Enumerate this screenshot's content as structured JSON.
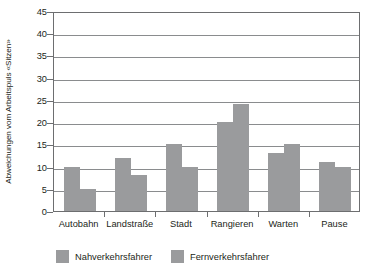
{
  "chart_data": {
    "type": "bar",
    "title": "",
    "subtitle": "",
    "xlabel": "",
    "ylabel": "Abweichungen vom Arbeitspuls «Sitzen»",
    "ylim": [
      0,
      45
    ],
    "ytick_step": 5,
    "yticks": [
      "0",
      "5",
      "10",
      "15",
      "20",
      "25",
      "30",
      "35",
      "40",
      "45"
    ],
    "grid": true,
    "legend_position": "bottom-left",
    "categories": [
      "Autobahn",
      "Landstraße",
      "Stadt",
      "Rangieren",
      "Warten",
      "Pause"
    ],
    "series": [
      {
        "name": "Nahverkehrsfahrer",
        "color": "#9a9b9d",
        "values": [
          10,
          12,
          15,
          20,
          13,
          11
        ]
      },
      {
        "name": "Fernverkehrsfahrer",
        "color": "#9a9b9d",
        "values": [
          5,
          8,
          10,
          24,
          15,
          10
        ]
      }
    ]
  },
  "legend": {
    "items": [
      {
        "label": "Nahverkehrsfahrer",
        "swatch": "legend-swatch-nahverkehrsfahrer"
      },
      {
        "label": "Fernverkehrsfahrer",
        "swatch": "legend-swatch-fernverkehrsfahrer"
      }
    ]
  },
  "colors": {
    "bar": "#9a9b9d",
    "axis": "#6d6e70",
    "grid": "#8a8c8e",
    "text": "#231f20",
    "background": "#ffffff"
  }
}
